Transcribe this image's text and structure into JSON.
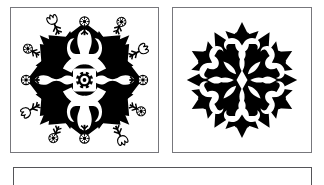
{
  "page": {
    "background_color": "#ffffff",
    "ink_color": "#000000",
    "frame_color": "#77777c",
    "width": 324,
    "height": 185
  },
  "panels": [
    {
      "id": "panel-left",
      "name": "papercut-panel-left",
      "caption": "",
      "figure_name": "eight-point-snowflake-with-tulip-and-daisy-border",
      "symmetry": "8-fold radial",
      "ink_color": "#000000",
      "frame_color": "#77777c",
      "elements": [
        "eight-pointed-star-body",
        "center-daisy-rosette",
        "four-corner-tulip-sprigs",
        "four-axis-daisy-sprigs",
        "tulip-pair-notches-top-and-bottom"
      ]
    },
    {
      "id": "panel-right",
      "name": "papercut-panel-right",
      "caption": "",
      "figure_name": "six-point-snowflake-with-petal-rosette-core",
      "symmetry": "6-fold radial",
      "ink_color": "#000000",
      "frame_color": "#77777c",
      "elements": [
        "six-pointed-star-arms",
        "center-petal-rosette",
        "scroll-volute-joints",
        "outer-star-tips"
      ]
    },
    {
      "id": "panel-bottom",
      "name": "blank-caption-panel",
      "caption": "",
      "figure_name": "empty-frame",
      "ink_color": "#000000",
      "frame_color": "#555559",
      "elements": []
    }
  ]
}
